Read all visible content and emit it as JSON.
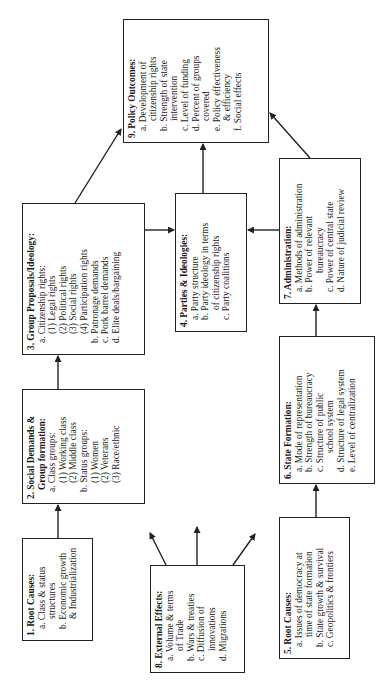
{
  "boxes": {
    "b1": {
      "title": "1. Root Causes:",
      "lines": [
        "a. Class & status",
        "structures",
        "b. Economic growth",
        "& Industrialization"
      ]
    },
    "b2": {
      "title": "2. Social Demands &",
      "title2": "Group formation:",
      "lines": [
        "a. Class groups:",
        "(1) Working class",
        "(2) Middle class",
        "b. Status groups:",
        "(1) Women",
        "(2) Veterans",
        "(3) Race/ethnic"
      ]
    },
    "b3": {
      "title": "3. Group Proposals/Ideology:",
      "lines": [
        "a. Citizenship rights:",
        "(1) Legal rights",
        "(2) Political rights",
        "(3) Social rights",
        "(4) Participation rights",
        "b. Patronage demands",
        "c. Pork barrel demands",
        "d. Elite deals/bargaining"
      ]
    },
    "b4": {
      "title": "4. Parties & Ideologies:",
      "lines": [
        "a. Party structure",
        "b. Party ideology in terms",
        "of citizenship rights",
        "c. Party coalitions"
      ]
    },
    "b5": {
      "title": "5. Root Causes:",
      "lines": [
        "a. Issues of democracy at",
        "time of state formation",
        "b. State growth & survival",
        "c. Geopolitics & frontiers"
      ]
    },
    "b6": {
      "title": "6. State Formation:",
      "lines": [
        "a. Mode of representation",
        "b. Strength of bureaucracy",
        "c. Structure of public",
        "school system",
        "d. Structure of legal system",
        "e. Level of centralization"
      ]
    },
    "b7": {
      "title": "7. Administration:",
      "lines": [
        "a. Methods of administration",
        "b. Power of relevant",
        "bureaucracy",
        "c. Power of central state",
        "d. Nature of judicial review"
      ]
    },
    "b8": {
      "title": "8. External Effects:",
      "lines": [
        "a. Volume & terms",
        "of Trade",
        "b. Wars & treaties",
        "c. Diffusion of",
        "innovations",
        "d. Migrations"
      ]
    },
    "b9": {
      "title": "9. Policy Outcomes:",
      "lines": [
        "a. Development of",
        "citizenship rights",
        "b. Strength of state",
        "intervention",
        "c. Level of funding",
        "d. Percent of groups",
        "covered",
        "e. Policy effectiveness",
        "& efficiency",
        "f. Social effects"
      ]
    }
  },
  "colors": {
    "line": "#222222",
    "background": "#ffffff"
  }
}
